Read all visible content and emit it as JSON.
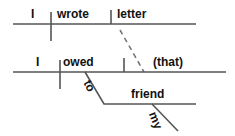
{
  "diagram": {
    "type": "reed-kellogg-sentence-diagram",
    "sentence": "I wrote letter I owed (that) to my friend",
    "line_color": "#555555",
    "text_color": "#111111",
    "background_color": "#ffffff",
    "clauses": [
      {
        "id": "main-clause",
        "baseline": {
          "x1": 13,
          "y1": 24,
          "x2": 196,
          "y2": 24
        },
        "words": [
          {
            "role": "subject",
            "text": "I",
            "x": 31,
            "y": 8
          },
          {
            "role": "verb",
            "text": "wrote",
            "x": 57,
            "y": 8
          },
          {
            "role": "direct-object",
            "text": "letter",
            "x": 117,
            "y": 8
          }
        ],
        "dividers": [
          {
            "role": "subject-verb-divider",
            "x": 51,
            "y1": 12,
            "y2": 41,
            "crosses": true
          },
          {
            "role": "verb-object-divider",
            "x": 111,
            "y1": 10,
            "y2": 24,
            "crosses": false
          }
        ]
      },
      {
        "id": "relative-clause",
        "baseline": {
          "x1": 13,
          "y1": 72,
          "x2": 226,
          "y2": 72
        },
        "words": [
          {
            "role": "subject",
            "text": "I",
            "x": 36,
            "y": 56
          },
          {
            "role": "verb",
            "text": "owed",
            "x": 63,
            "y": 56
          },
          {
            "role": "direct-object",
            "text": "(that)",
            "x": 153,
            "y": 56
          }
        ],
        "dividers": [
          {
            "role": "subject-verb-divider",
            "x": 60,
            "y1": 60,
            "y2": 89,
            "crosses": true
          },
          {
            "role": "verb-object-divider",
            "x": 124,
            "y1": 58,
            "y2": 72,
            "crosses": false
          }
        ]
      }
    ],
    "connectors": [
      {
        "role": "relative-pronoun-link",
        "style": "dashed",
        "label": "",
        "x1": 120,
        "y1": 30,
        "x2": 144,
        "y2": 72
      }
    ],
    "modifiers": [
      {
        "role": "prepositional-phrase",
        "preposition": "to",
        "slant": {
          "x1": 85,
          "y1": 72,
          "x2": 104,
          "y2": 104
        },
        "label_pos": {
          "x": 92,
          "y": 78
        },
        "object_baseline": {
          "x1": 104,
          "y1": 104,
          "x2": 196,
          "y2": 104
        },
        "object": {
          "text": "friend",
          "x": 131,
          "y": 88
        }
      },
      {
        "role": "possessive-modifier",
        "preposition": "my",
        "slant": {
          "x1": 152,
          "y1": 104,
          "x2": 178,
          "y2": 131
        },
        "label_pos": {
          "x": 158,
          "y": 110
        },
        "object_baseline": null,
        "object": {
          "text": "",
          "x": 0,
          "y": 0
        }
      }
    ]
  }
}
